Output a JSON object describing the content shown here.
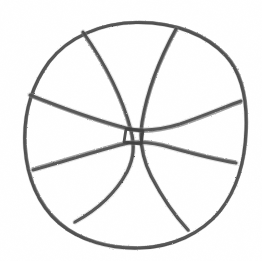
{
  "image": {
    "kind": "hand-drawn-sketch",
    "subject": "basketball",
    "medium": "pencil on paper",
    "width": 262,
    "height": 261,
    "background_color": "#ffffff",
    "stroke_color": "#4a4a4a",
    "stroke_color_light": "#6e6e6e",
    "stroke_color_dark": "#3a3a3a",
    "caption": "Rough pencil sketch of a basketball with four curved seam lines"
  },
  "drawing": {
    "outline": {
      "label": "ball outline",
      "shape": "circle",
      "center_x": 136,
      "center_y": 135,
      "radius_x": 111,
      "radius_y": 113,
      "bounds": {
        "left": 25,
        "top": 22,
        "right": 247,
        "bottom": 248
      },
      "stroke_width": 3.1,
      "path": "M136.5,22.5 C175,22 207,35 226,56 C244,76 247,104 246,130 C245,160 238,188 220,211 C201,234 172,247 140,248 C110,249 80,241 59,223 C38,205 27,177 25,148 C23,118 30,88 49,62 C68,37 101,23 136.5,22.5 Z"
    },
    "seams": [
      {
        "name": "seam-vertical-left",
        "label": "left vertical seam",
        "orientation": "vertical",
        "start": {
          "x": 83,
          "y": 32
        },
        "end": {
          "x": 75,
          "y": 222
        },
        "stroke_width": 3.0,
        "path": "M83,32 C104,62 122,96 131,130 C135,146 134,158 127,172 C114,196 95,211 75,222"
      },
      {
        "name": "seam-vertical-right",
        "label": "right vertical seam",
        "orientation": "vertical",
        "start": {
          "x": 176,
          "y": 29
        },
        "end": {
          "x": 188,
          "y": 230
        },
        "stroke_width": 3.0,
        "path": "M176,29 C160,58 147,92 142,122 C139,141 142,158 151,176 C163,199 176,217 188,230"
      },
      {
        "name": "seam-horizontal-upper",
        "label": "upper horizontal seam",
        "orientation": "horizontal",
        "start": {
          "x": 30,
          "y": 95
        },
        "end": {
          "x": 241,
          "y": 101
        },
        "stroke_width": 3.0,
        "path": "M30,95 C60,107 95,120 126,128 C142,132 160,130 180,124 C206,115 227,106 241,101"
      },
      {
        "name": "seam-horizontal-lower",
        "label": "lower horizontal seam",
        "orientation": "horizontal",
        "start": {
          "x": 33,
          "y": 170
        },
        "end": {
          "x": 236,
          "y": 163
        },
        "stroke_width": 3.0,
        "path": "M33,170 C62,162 94,152 120,145 C134,141 152,142 172,148 C201,156 224,161 236,163"
      }
    ],
    "center_junction": {
      "label": "center seam crossing",
      "shape": "small quadrilateral",
      "center_x": 133,
      "center_y": 136,
      "width": 17,
      "height": 14,
      "corners": [
        {
          "x": 126,
          "y": 129
        },
        {
          "x": 143,
          "y": 131
        },
        {
          "x": 141,
          "y": 144
        },
        {
          "x": 124,
          "y": 142
        }
      ],
      "stroke_width": 2.8
    }
  }
}
